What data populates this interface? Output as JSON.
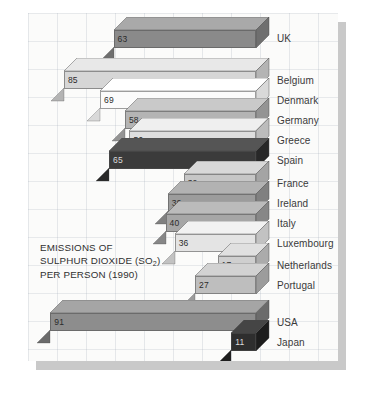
{
  "chart_data": {
    "type": "bar",
    "orientation": "horizontal",
    "title": "EMISSIONS OF SULPHUR DIOXIDE (SO2) PER PERSON (1990)",
    "title_lines": [
      "EMISSIONS OF",
      "SULPHUR DIOXIDE (SO",
      "PER PERSON (1990)"
    ],
    "xlabel": "",
    "ylabel": "",
    "grid": true,
    "legend": "none",
    "xlim": [
      0,
      91
    ],
    "categories": [
      "UK",
      "Belgium",
      "Denmark",
      "Germany",
      "Greece",
      "Spain",
      "France",
      "Ireland",
      "Italy",
      "Luxembourg",
      "Netherlands",
      "Portugal",
      "USA",
      "Japan"
    ],
    "values": [
      63,
      85,
      69,
      58,
      56,
      65,
      32,
      39,
      40,
      36,
      17,
      27,
      91,
      11
    ],
    "series": [
      {
        "name": "SO2 emissions per person (1990)",
        "values": [
          63,
          85,
          69,
          58,
          56,
          65,
          32,
          39,
          40,
          36,
          17,
          27,
          91,
          11
        ]
      }
    ]
  },
  "chart": {
    "title": {
      "line1": "EMISSIONS OF",
      "line2_pre": "SULPHUR DIOXIDE (SO",
      "line2_sub": "2",
      "line2_post": ")",
      "line3": "PER PERSON (1990)"
    },
    "bars": [
      {
        "label": "UK",
        "value": 63,
        "value_text": "63",
        "face": "#8a8a8a",
        "top": "#a9a9a9",
        "side": "#6f6f6f"
      },
      {
        "label": "Belgium",
        "value": 85,
        "value_text": "85",
        "face": "#d6d6d6",
        "top": "#e8e8e8",
        "side": "#b4b4b4"
      },
      {
        "label": "Denmark",
        "value": 69,
        "value_text": "69",
        "face": "#fbfbfb",
        "top": "#ffffff",
        "side": "#d9d9d9"
      },
      {
        "label": "Germany",
        "value": 58,
        "value_text": "58",
        "face": "#b4b4b4",
        "top": "#c9c9c9",
        "side": "#949494"
      },
      {
        "label": "Greece",
        "value": 56,
        "value_text": "56",
        "face": "#dedede",
        "top": "#efefef",
        "side": "#bcbcbc"
      },
      {
        "label": "Spain",
        "value": 65,
        "value_text": "65",
        "face": "#3b3b3b",
        "top": "#555555",
        "side": "#282828"
      },
      {
        "label": "France",
        "value": 32,
        "value_text": "32",
        "face": "#c6c6c6",
        "top": "#d8d8d8",
        "side": "#a4a4a4"
      },
      {
        "label": "Ireland",
        "value": 39,
        "value_text": "39",
        "face": "#9c9c9c",
        "top": "#b2b2b2",
        "side": "#808080"
      },
      {
        "label": "Italy",
        "value": 40,
        "value_text": "40",
        "face": "#a6a6a6",
        "top": "#bbbbbb",
        "side": "#878787"
      },
      {
        "label": "Luxembourg",
        "value": 36,
        "value_text": "36",
        "face": "#e4e4e4",
        "top": "#f2f2f2",
        "side": "#c2c2c2"
      },
      {
        "label": "Netherlands",
        "value": 17,
        "value_text": "17",
        "face": "#cfcfcf",
        "top": "#e0e0e0",
        "side": "#ababab"
      },
      {
        "label": "Portugal",
        "value": 27,
        "value_text": "27",
        "face": "#bebebe",
        "top": "#d2d2d2",
        "side": "#9c9c9c"
      },
      {
        "label": "USA",
        "value": 91,
        "value_text": "91",
        "face": "#8d8d8d",
        "top": "#a5a5a5",
        "side": "#6b6b6b"
      },
      {
        "label": "Japan",
        "value": 11,
        "value_text": "11",
        "face": "#2e2e2e",
        "top": "#454545",
        "side": "#1d1d1d"
      }
    ],
    "colors": {
      "background": "#ffffff",
      "canvas": "#fbfbfa",
      "grid_line": "#96a0af",
      "shadow": "#c9c9c9",
      "text": "#3a3a3a"
    }
  }
}
